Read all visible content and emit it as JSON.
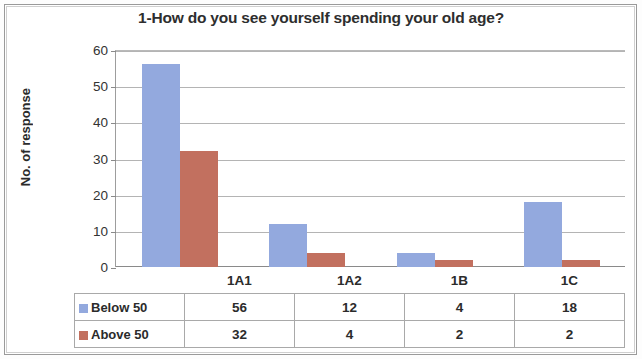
{
  "chart_data": {
    "type": "bar",
    "title": "1-How do you see yourself spending your old age?",
    "xlabel": "",
    "ylabel": "No. of response",
    "categories": [
      "1A1",
      "1A2",
      "1B",
      "1C"
    ],
    "series": [
      {
        "name": "Below 50",
        "values": [
          56,
          12,
          4,
          18
        ],
        "color": "#93a9de"
      },
      {
        "name": "Above 50",
        "values": [
          32,
          4,
          2,
          2
        ],
        "color": "#c2705f"
      }
    ],
    "ylim": [
      0,
      60
    ],
    "yticks": [
      0,
      10,
      20,
      30,
      40,
      50,
      60
    ],
    "ytick_labels": [
      "0",
      "10",
      "20",
      "30",
      "40",
      "50",
      "60"
    ],
    "grid": true,
    "legend_position": "data-table-below"
  },
  "table": {
    "header_blank": "",
    "column_headers": [
      "1A1",
      "1A2",
      "1B",
      "1C"
    ],
    "rows": [
      {
        "label": "Below 50",
        "swatch": "blue-square-icon",
        "values": [
          "56",
          "12",
          "4",
          "18"
        ]
      },
      {
        "label": "Above 50",
        "swatch": "red-square-icon",
        "values": [
          "32",
          "4",
          "2",
          "2"
        ]
      }
    ]
  }
}
